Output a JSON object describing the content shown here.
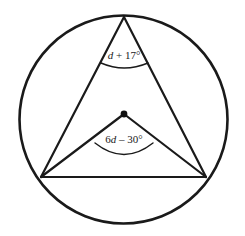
{
  "figure": {
    "background_color": "#ffffff",
    "stroke_color": "#1a1a1a"
  },
  "labels": {
    "inscribed_angle": "d + 17°",
    "central_angle": "6d – 30°"
  },
  "chart_data": {
    "type": "diagram",
    "shapes": [
      {
        "name": "circle",
        "kind": "circle",
        "cx": 123.5,
        "cy": 119.5,
        "r": 104,
        "stroke": "#1a1a1a",
        "stroke_width": 2.6,
        "fill": "none"
      },
      {
        "name": "center-point",
        "kind": "point",
        "x": 124,
        "y": 114,
        "r": 3.4,
        "fill": "#111111"
      },
      {
        "name": "chord-apex-to-left",
        "kind": "line",
        "x1": 124,
        "y1": 17,
        "x2": 41,
        "y2": 177
      },
      {
        "name": "chord-apex-to-right",
        "kind": "line",
        "x1": 124,
        "y1": 17,
        "x2": 206,
        "y2": 177
      },
      {
        "name": "radius-center-to-left",
        "kind": "line",
        "x1": 124,
        "y1": 114,
        "x2": 41,
        "y2": 177
      },
      {
        "name": "radius-center-to-right",
        "kind": "line",
        "x1": 124,
        "y1": 114,
        "x2": 206,
        "y2": 177
      },
      {
        "name": "chord-left-to-right",
        "kind": "line",
        "x1": 41,
        "y1": 177,
        "x2": 206,
        "y2": 177
      },
      {
        "name": "arc-marker-inscribed",
        "kind": "arc",
        "path": "M 101 63 Q 124 73 148 63"
      },
      {
        "name": "arc-marker-central",
        "kind": "arc",
        "path": "M 95 143 Q 124 166 153 143"
      }
    ],
    "points": [
      {
        "name": "apex",
        "x": 124,
        "y": 17,
        "on_circle": true
      },
      {
        "name": "left-vertex",
        "x": 41,
        "y": 177,
        "on_circle": true
      },
      {
        "name": "right-vertex",
        "x": 206,
        "y": 177,
        "on_circle": true
      },
      {
        "name": "center",
        "x": 124,
        "y": 114,
        "on_circle": false
      }
    ],
    "annotations": [
      {
        "name": "inscribed-angle-label",
        "text": "d + 17°",
        "x": 124,
        "y": 57,
        "vertex": "apex",
        "angle_type": "inscribed"
      },
      {
        "name": "central-angle-label",
        "text": "6d – 30°",
        "x": 124,
        "y": 140,
        "vertex": "center",
        "angle_type": "central"
      }
    ]
  }
}
